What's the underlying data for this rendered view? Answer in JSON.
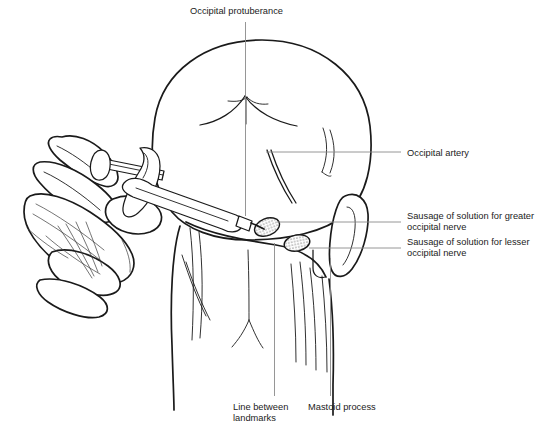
{
  "figure": {
    "background_color": "#ffffff",
    "line_color": "#1a1a1a",
    "leader_color": "#8a8a8a",
    "text_color": "#1c1c1c"
  },
  "labels": {
    "occipital_protuberance": "Occipital protuberance",
    "occipital_artery": "Occipital artery",
    "sausage_greater_line1": "Sausage of solution for greater",
    "sausage_greater_line2": "occipital nerve",
    "sausage_lesser_line1": "Sausage of solution for lesser",
    "sausage_lesser_line2": "occipital nerve",
    "line_between_line1": "Line between",
    "line_between_line2": "landmarks",
    "mastoid_process": "Mastoid process"
  },
  "parts": {
    "head": "posterior-head-outline",
    "ear": "right-ear",
    "hand": "clinician-hand",
    "syringe": "syringe-with-needle",
    "greater_site": "greater-occipital-nerve-injection-site",
    "lesser_site": "lesser-occipital-nerve-injection-site",
    "artery": "occipital-artery-vessel",
    "midline": "midline-landmark-line",
    "neck": "neck-and-trapezius"
  }
}
